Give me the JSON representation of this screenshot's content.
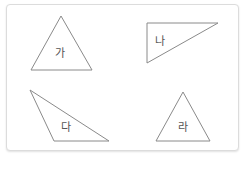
{
  "figure": {
    "shapes": [
      {
        "id": "ga",
        "label": "가",
        "points": "61,16 31,70 92,70",
        "label_pos": [
          60,
          57
        ]
      },
      {
        "id": "na",
        "label": "나",
        "points": "147,23 218,23 147,63",
        "label_pos": [
          160,
          45
        ]
      },
      {
        "id": "da",
        "label": "다",
        "points": "30,90 54,141 109,141",
        "label_pos": [
          66,
          131
        ]
      },
      {
        "id": "ra",
        "label": "라",
        "points": "183,92 156,141 210,141",
        "label_pos": [
          183,
          131
        ]
      }
    ],
    "stroke_color": "#8a8a8a",
    "frame_border_color": "#dcdcdc"
  }
}
